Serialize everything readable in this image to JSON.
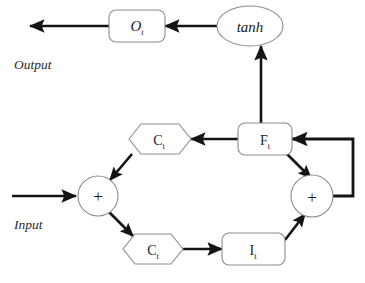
{
  "diagram": {
    "background_color": "#ffffff",
    "shape_stroke_color": "#8c8c8c",
    "arrow_color": "#141414",
    "text_color": "#1b1b1b"
  },
  "labels": {
    "output": "Output",
    "input": "Input"
  },
  "nodes": {
    "output_gate": {
      "main": "O",
      "sub": "t",
      "shape": "rounded-rect",
      "italic": true
    },
    "tanh": {
      "main": "tanh",
      "shape": "ellipse",
      "italic": true
    },
    "cell_state_top": {
      "main": "C",
      "sub": "t",
      "shape": "hexagon",
      "italic": false
    },
    "forget_gate": {
      "main": "F",
      "sub": "t",
      "shape": "rounded-rect",
      "italic": false
    },
    "cell_state_bottom": {
      "main": "C",
      "sub": "t",
      "shape": "hexagon",
      "italic": false
    },
    "input_gate": {
      "main": "I",
      "sub": "t",
      "shape": "rounded-rect",
      "italic": false
    },
    "adder_left": {
      "main": "+",
      "shape": "circle"
    },
    "adder_right": {
      "main": "+",
      "shape": "circle"
    }
  },
  "edges": [
    {
      "name": "output-arrow",
      "from": "output_gate",
      "to": "output-label"
    },
    {
      "name": "tanh-to-output-gate",
      "from": "tanh",
      "to": "output_gate"
    },
    {
      "name": "forget-to-tanh",
      "from": "forget_gate",
      "to": "tanh"
    },
    {
      "name": "forget-to-cell-top",
      "from": "forget_gate",
      "to": "cell_state_top"
    },
    {
      "name": "cell-top-to-adder-left",
      "from": "cell_state_top",
      "to": "adder_left"
    },
    {
      "name": "input-arrow",
      "from": "input-label",
      "to": "adder_left"
    },
    {
      "name": "adder-left-to-cell-bottom",
      "from": "adder_left",
      "to": "cell_state_bottom"
    },
    {
      "name": "cell-bottom-to-input-gate",
      "from": "cell_state_bottom",
      "to": "input_gate"
    },
    {
      "name": "input-gate-to-adder-right",
      "from": "input_gate",
      "to": "adder_right"
    },
    {
      "name": "forget-to-adder-right",
      "from": "forget_gate",
      "to": "adder_right"
    },
    {
      "name": "feedback-loop",
      "from": "adder_right",
      "to": "forget_gate"
    }
  ]
}
